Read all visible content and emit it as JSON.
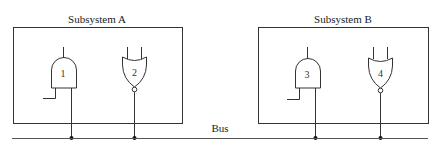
{
  "diagram": {
    "subsystems": [
      {
        "label": "Subsystem A"
      },
      {
        "label": "Subsystem B"
      }
    ],
    "gates": [
      {
        "number": "1",
        "type": "AND",
        "subsystem": "Subsystem A"
      },
      {
        "number": "2",
        "type": "NOR",
        "subsystem": "Subsystem A"
      },
      {
        "number": "3",
        "type": "AND",
        "subsystem": "Subsystem B"
      },
      {
        "number": "4",
        "type": "NOR",
        "subsystem": "Subsystem B"
      }
    ],
    "bus": {
      "label": "Bus"
    },
    "colors": {
      "line": "#333333",
      "background": "#ffffff"
    }
  }
}
